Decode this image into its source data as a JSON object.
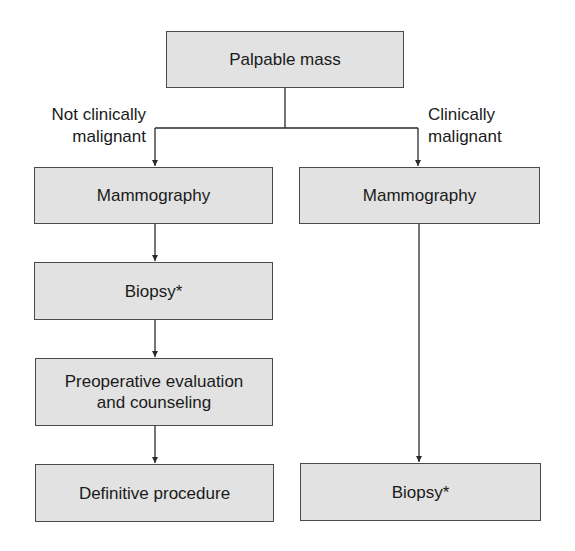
{
  "diagram": {
    "type": "flowchart",
    "nodes": {
      "palpable_mass": {
        "label": "Palpable mass"
      },
      "left_mammography": {
        "label": "Mammography"
      },
      "right_mammography": {
        "label": "Mammography"
      },
      "left_biopsy": {
        "label": "Biopsy*"
      },
      "preop_evaluation": {
        "line1": "Preoperative evaluation",
        "line2": "and counseling"
      },
      "definitive_procedure": {
        "label": "Definitive procedure"
      },
      "right_biopsy": {
        "label": "Biopsy*"
      }
    },
    "branch_labels": {
      "left": {
        "line1": "Not clinically",
        "line2": "malignant"
      },
      "right": {
        "line1": "Clinically",
        "line2": "malignant"
      }
    },
    "edges": [
      {
        "from": "Palpable mass",
        "to": "Mammography (left)",
        "label": "Not clinically malignant"
      },
      {
        "from": "Palpable mass",
        "to": "Mammography (right)",
        "label": "Clinically malignant"
      },
      {
        "from": "Mammography (left)",
        "to": "Biopsy* (left)"
      },
      {
        "from": "Biopsy* (left)",
        "to": "Preoperative evaluation and counseling"
      },
      {
        "from": "Preoperative evaluation and counseling",
        "to": "Definitive procedure"
      },
      {
        "from": "Mammography (right)",
        "to": "Biopsy* (right)"
      }
    ],
    "colors": {
      "box_fill": "#e2e2e2",
      "box_border": "#4a4a4a",
      "line": "#2a2a2a",
      "text": "#1a1a1a"
    }
  }
}
